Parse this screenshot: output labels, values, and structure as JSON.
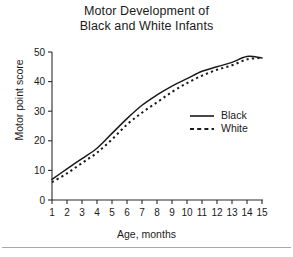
{
  "figure": {
    "title_lines": [
      "Motor Development of",
      "Black and White Infants"
    ],
    "has_bottom_rule": true
  },
  "chart_data": {
    "type": "line",
    "title": "Motor Development of Black and White Infants",
    "xlabel": "Age, months",
    "ylabel": "Motor point score",
    "x": [
      1,
      2,
      3,
      4,
      5,
      6,
      7,
      8,
      9,
      10,
      11,
      12,
      13,
      14,
      15
    ],
    "xlim": [
      1,
      15
    ],
    "ylim": [
      0,
      50
    ],
    "xticks": [
      1,
      2,
      3,
      4,
      5,
      6,
      7,
      8,
      9,
      10,
      11,
      12,
      13,
      14,
      15
    ],
    "xticklabels": [
      "1",
      "2",
      "3",
      "4",
      "5",
      "6",
      "7",
      "8",
      "9",
      "10",
      "11",
      "12",
      "13",
      "14",
      "15"
    ],
    "yticks": [
      0,
      10,
      20,
      30,
      40,
      50
    ],
    "yticklabels": [
      "0",
      "10",
      "20",
      "30",
      "40",
      "50"
    ],
    "grid": false,
    "legend_position": "center-right",
    "series": [
      {
        "name": "Black",
        "style": "solid",
        "color": "#1a1a1a",
        "values": [
          7.0,
          10.5,
          14.0,
          17.5,
          22.5,
          27.5,
          32.0,
          35.5,
          38.5,
          41.0,
          43.5,
          45.0,
          46.5,
          48.5,
          48.0
        ]
      },
      {
        "name": "White",
        "style": "dashed",
        "color": "#1a1a1a",
        "values": [
          6.0,
          9.0,
          12.5,
          16.0,
          20.5,
          25.5,
          29.5,
          33.0,
          36.5,
          39.5,
          42.0,
          44.0,
          45.5,
          47.5,
          48.0
        ]
      }
    ]
  },
  "legend": {
    "items": [
      {
        "label": "Black",
        "style": "solid"
      },
      {
        "label": "White",
        "style": "dashed"
      }
    ]
  },
  "colors": {
    "ink": "#1a1a1a",
    "axis": "#2b2b2b",
    "rule": "#a9a9a9",
    "background": "#ffffff"
  }
}
